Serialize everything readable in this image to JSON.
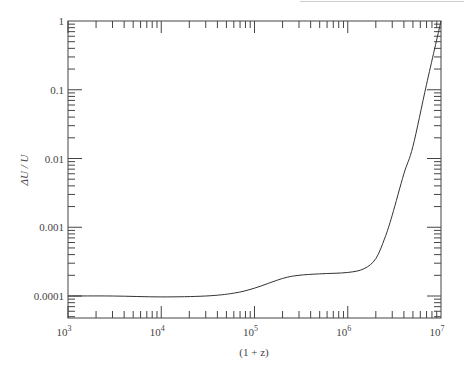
{
  "chart_data": {
    "type": "line",
    "title": "",
    "xlabel": "(1 + z)",
    "ylabel": "ΔU / U",
    "xscale": "log",
    "yscale": "log",
    "xlim": [
      1000,
      10000000
    ],
    "ylim": [
      5e-05,
      1
    ],
    "x_ticks": [
      {
        "v": 1000,
        "base": "10",
        "exp": "3"
      },
      {
        "v": 10000,
        "base": "10",
        "exp": "4"
      },
      {
        "v": 100000,
        "base": "10",
        "exp": "5"
      },
      {
        "v": 1000000,
        "base": "10",
        "exp": "6"
      },
      {
        "v": 10000000,
        "base": "10",
        "exp": "7"
      }
    ],
    "y_ticks": [
      {
        "v": 1,
        "label": "1"
      },
      {
        "v": 0.1,
        "label": "0.1"
      },
      {
        "v": 0.01,
        "label": "0.01"
      },
      {
        "v": 0.001,
        "label": "0.001"
      },
      {
        "v": 0.0001,
        "label": "0.0001"
      }
    ],
    "grid": false,
    "legend": null,
    "series": [
      {
        "name": "ΔU/U",
        "x": [
          1000,
          3000,
          10000,
          30000,
          60000,
          100000,
          200000,
          300000,
          500000,
          1000000,
          1500000,
          2000000,
          2500000,
          3000000,
          4000000,
          5000000,
          7000000,
          10000000
        ],
        "y": [
          0.0001,
          0.0001,
          9.7e-05,
          0.0001,
          0.00011,
          0.00013,
          0.00018,
          0.0002,
          0.00021,
          0.00022,
          0.00025,
          0.00035,
          0.0007,
          0.0015,
          0.006,
          0.015,
          0.12,
          1.0
        ]
      }
    ]
  }
}
